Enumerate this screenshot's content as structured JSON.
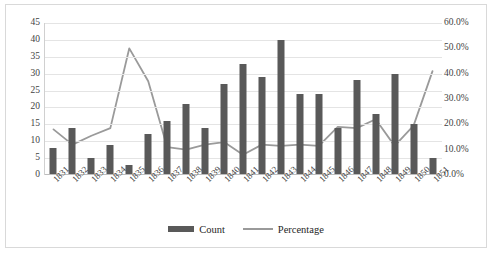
{
  "chart_data": {
    "type": "bar",
    "title": "",
    "xlabel": "",
    "ylabel": "",
    "grid": true,
    "legend_position": "bottom",
    "categories": [
      "1831",
      "1832",
      "1833",
      "1834",
      "1835",
      "1836",
      "1837",
      "1838",
      "1839",
      "1840",
      "1841",
      "1842",
      "1843",
      "1844",
      "1845",
      "1846",
      "1847",
      "1848",
      "1849",
      "1850",
      "1851"
    ],
    "series": [
      {
        "name": "Count",
        "type": "bar",
        "axis": "left",
        "color": "#595959",
        "values": [
          8,
          14,
          5,
          9,
          3,
          12,
          16,
          21,
          14,
          27,
          33,
          29,
          40,
          24,
          24,
          14,
          28,
          18,
          30,
          15,
          5
        ]
      },
      {
        "name": "Percentage",
        "type": "line",
        "axis": "right",
        "color": "#9a9a9a",
        "values": [
          18.0,
          12.0,
          15.5,
          18.5,
          50.0,
          37.0,
          11.0,
          10.0,
          12.0,
          13.0,
          8.0,
          12.0,
          11.5,
          12.0,
          11.5,
          19.0,
          18.5,
          22.0,
          11.5,
          19.5,
          41.0
        ]
      }
    ],
    "left_axis": {
      "min": 0,
      "max": 45,
      "step": 5,
      "ticks": [
        "0",
        "5",
        "10",
        "15",
        "20",
        "25",
        "30",
        "35",
        "40",
        "45"
      ]
    },
    "right_axis": {
      "min": 0,
      "max": 60,
      "step": 10,
      "ticks": [
        "0.0%",
        "10.0%",
        "20.0%",
        "30.0%",
        "40.0%",
        "50.0%",
        "60.0%"
      ]
    }
  },
  "legend": {
    "count_label": "Count",
    "percentage_label": "Percentage"
  }
}
